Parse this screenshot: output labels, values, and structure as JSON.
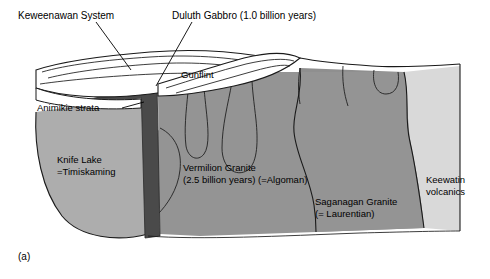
{
  "figure": {
    "panel_letter": "(a)",
    "background_color": "#ffffff"
  },
  "labels": {
    "keweenawan": "Keweenawan System",
    "duluth_gabbro": "Duluth Gabbro (1.0 billion years)",
    "gunflint": "Gunflint",
    "animikie": "Animikie strata",
    "knife_lake_line1": "Knife Lake",
    "knife_lake_line2": "=Timiskaming",
    "vermilion_line1": "Vermilion Granite",
    "vermilion_line2": "(2.5 billion years) (=Algoman)",
    "saganagan_line1": "Saganagan Granite",
    "saganagan_line2": "(= Laurentian)",
    "keewatin_line1": "Keewatin",
    "keewatin_line2": "volcanics"
  },
  "units": [
    {
      "name": "Keweenawan System",
      "kind": "sedimentary-layers",
      "color": "#ffffff"
    },
    {
      "name": "Gunflint",
      "kind": "sedimentary-layers",
      "color": "#ffffff"
    },
    {
      "name": "Animikie strata",
      "kind": "sedimentary-layers",
      "color": "#ffffff"
    },
    {
      "name": "Duluth Gabbro",
      "kind": "intrusive-dike",
      "color": "#4a4a4a"
    },
    {
      "name": "Knife Lake / Timiskaming",
      "kind": "metamorphic",
      "color": "#adadad"
    },
    {
      "name": "Vermilion Granite / Algoman",
      "kind": "granite",
      "color": "#949494"
    },
    {
      "name": "Saganagan Granite / Laurentian",
      "kind": "granite",
      "color": "#8f8f8f"
    },
    {
      "name": "Keewatin volcanics",
      "kind": "volcanic",
      "color": "#d9d9d9"
    }
  ],
  "colors": {
    "outline": "#1a1a1a",
    "gabbro_dark": "#4a4a4a",
    "knife_lake_gray": "#adadad",
    "vermilion_gray": "#949494",
    "saganagan_gray": "#8f8f8f",
    "keewatin_light": "#d9d9d9",
    "strata_white": "#ffffff"
  }
}
